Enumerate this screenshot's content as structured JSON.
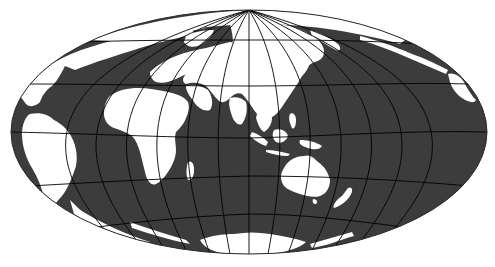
{
  "map": {
    "projection": "Hammer (equal-area, pseudo-azimuthal ellipse)",
    "central_meridian_region": "Asia / Indian Ocean",
    "colors": {
      "ocean": "#3c3c3c",
      "land": "#ffffff",
      "graticule": "#000000",
      "background": "#ffffff"
    },
    "graticule": {
      "meridian_spacing_deg": 20,
      "parallel_spacing_deg": 30
    },
    "ellipse": {
      "cx": 249,
      "cy": 132,
      "rx": 238,
      "ry": 122
    },
    "landmasses": [
      "North America",
      "South America",
      "Greenland",
      "Europe",
      "Africa",
      "Madagascar",
      "Asia",
      "Japan",
      "Maritime Southeast Asia",
      "Australia",
      "New Zealand",
      "Antarctica",
      "Alaska"
    ]
  }
}
